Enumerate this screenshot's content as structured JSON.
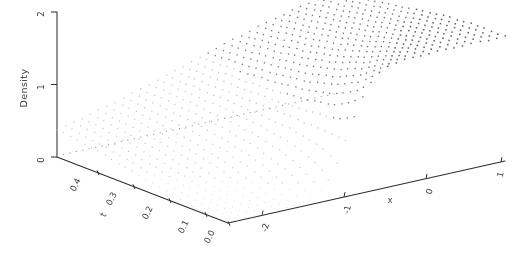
{
  "figure": {
    "kind": "3d-perspective-surface-plot",
    "render_style": "stippled dot mesh, greyscale, scanned print",
    "background_color": "#ffffff",
    "ink_color": "#2e2e2e"
  },
  "chart_data": {
    "type": "surface",
    "title": "",
    "zlabel": "Density",
    "xlabel": "x",
    "ylabel": "t",
    "zlim": [
      0,
      2
    ],
    "zticks": [
      "0",
      "1",
      "2"
    ],
    "ztick_values": [
      0,
      1,
      2
    ],
    "xlim": [
      -2.6,
      1.2
    ],
    "xticks": [
      "-2",
      "-1",
      "0",
      "1"
    ],
    "xtick_values": [
      -2,
      -1,
      0,
      1
    ],
    "ylim": [
      0.0,
      0.45
    ],
    "yticks": [
      "0.4",
      "0.3",
      "0.2",
      "0.1",
      "0.0"
    ],
    "ytick_values": [
      0.4,
      0.3,
      0.2,
      0.1,
      0.0
    ],
    "grid": false,
    "legend": false,
    "nx": 34,
    "ny": 26,
    "plateau_height": 1.72,
    "baseline_height": 0.02
  },
  "axes": {
    "vertical": {
      "label": "Density",
      "ticks": [
        "2",
        "1",
        "0"
      ]
    },
    "left": {
      "label": "t",
      "ticks": [
        "0.4",
        "0.3",
        "0.2",
        "0.1",
        "0.0"
      ]
    },
    "right": {
      "label": "x",
      "ticks": [
        "-2",
        "-1",
        "0",
        "1"
      ]
    }
  }
}
